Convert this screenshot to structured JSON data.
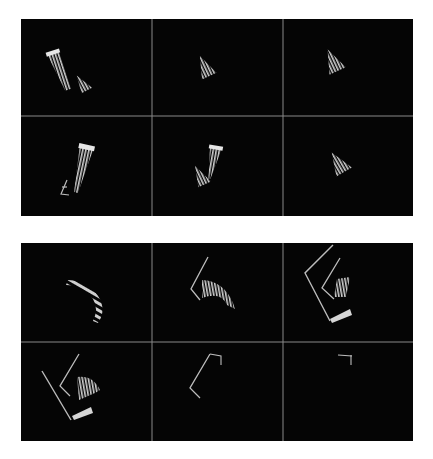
{
  "figure": {
    "background_color": "#ffffff",
    "panel_color": "#050505",
    "divider_color": "#8a8a8a",
    "shape_color": "#cfcfcf",
    "blocks": [
      {
        "id": "top",
        "rows": 2,
        "cols": 3,
        "panels": [
          {
            "index": 1,
            "content": "tall striped bar with small striped triangle"
          },
          {
            "index": 2,
            "content": "small striped triangle"
          },
          {
            "index": 3,
            "content": "small striped triangle"
          },
          {
            "index": 4,
            "content": "tall striped bar with small bracket outline"
          },
          {
            "index": 5,
            "content": "striped bar with small striped triangle"
          },
          {
            "index": 6,
            "content": "small striped triangle"
          }
        ]
      },
      {
        "id": "bottom",
        "rows": 2,
        "cols": 3,
        "panels": [
          {
            "index": 1,
            "content": "curved striped fan"
          },
          {
            "index": 2,
            "content": "bent line with curved striped fan"
          },
          {
            "index": 3,
            "content": "nested bent lines, striped block and wedge"
          },
          {
            "index": 4,
            "content": "nested bent lines, striped fan and wedge"
          },
          {
            "index": 5,
            "content": "bent line with small hook"
          },
          {
            "index": 6,
            "content": "small hook mark"
          }
        ]
      }
    ]
  }
}
